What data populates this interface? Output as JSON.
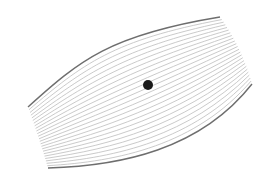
{
  "diagram": {
    "type": "streamlines",
    "background": "#ffffff",
    "line_count": 24,
    "flow_line_color": "#bdbdbd",
    "boundary_color": "#6e6e6e",
    "top_boundary": {
      "start": [
        28,
        107
      ],
      "control1": [
        80,
        60
      ],
      "control2": [
        110,
        35
      ],
      "end": [
        220,
        17
      ]
    },
    "bottom_boundary": {
      "start": [
        48,
        168
      ],
      "control1": [
        120,
        166
      ],
      "control2": [
        200,
        150
      ],
      "end": [
        252,
        84
      ]
    },
    "left_edge_mid": [
      40,
      140
    ],
    "right_edge_mid": [
      242,
      48
    ],
    "center_dot": {
      "cx": 148,
      "cy": 85,
      "r": 5,
      "color": "#1a1a1a"
    }
  }
}
